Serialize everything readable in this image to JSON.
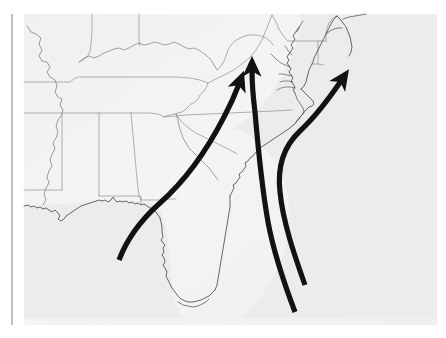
{
  "figure": {
    "kind": "map-figure",
    "canvas": {
      "width": 446,
      "height": 338,
      "background": "#ffffff"
    }
  },
  "map": {
    "region_label": "Southeastern United States",
    "panel": {
      "x": 24,
      "y": 14,
      "width": 413,
      "height": 311
    },
    "colors": {
      "page_background": "#ffffff",
      "map_background": "#f1f1f1",
      "land_fill": "#f3f3f3",
      "ocean_fill": "#eeeeee",
      "border_stroke": "#9a9a9a",
      "coastline_stroke": "#555555",
      "arrow_color": "#121212",
      "margin_rule": "#8e8e8e"
    },
    "strokes": {
      "state_border_width": 0.7,
      "coastline_width": 0.8,
      "arrow_width": 5.2,
      "margin_rule_width": 1.1
    }
  },
  "margin_rule": {
    "name": "left page rule",
    "x": 12,
    "y_top": 14,
    "y_bottom": 325
  },
  "arrows": [
    {
      "id": "arrow-1",
      "label": "Gulf track arrow",
      "origin": "eastern Gulf of Mexico",
      "destination": "Virginia / mid-Atlantic interior",
      "tail": [
        119,
        260
      ],
      "head": [
        240,
        79
      ],
      "head_angle_deg": 20,
      "path": "M119,260 C128,236 142,219 160,203 C186,180 208,148 224,117 C232,102 236,92 239,84"
    },
    {
      "id": "arrow-2",
      "label": "Atlantic inshore track arrow",
      "origin": "Atlantic waters southeast of Florida",
      "destination": "Virginia / Maryland",
      "tail": [
        295,
        312
      ],
      "head": [
        252,
        63
      ],
      "head_angle_deg": 0,
      "path": "M295,312 C284,283 274,254 268,222 C262,188 258,147 255,112 C253,96 252,82 252,70"
    },
    {
      "id": "arrow-3",
      "label": "Offshore recurving track arrow",
      "origin": "Atlantic waters east of Florida",
      "destination": "open Atlantic northeast of Cape Hatteras",
      "tail": [
        305,
        285
      ],
      "head": [
        347,
        73
      ],
      "head_angle_deg": 45,
      "path": "M305,285 C294,254 283,222 280,192 C277,166 284,146 300,131 C315,117 328,100 341,81"
    }
  ],
  "geography": {
    "state_outline_count": 18,
    "features": [
      "Gulf of Mexico coastline",
      "Florida peninsula",
      "Atlantic coastline",
      "Chesapeake Bay",
      "Delmarva Peninsula",
      "Mississippi River",
      "Ohio River",
      "Great Lakes edge"
    ],
    "states_shown": [
      "Missouri",
      "Illinois",
      "Indiana",
      "Ohio",
      "Kentucky",
      "Tennessee",
      "West Virginia",
      "Virginia",
      "Maryland",
      "Delaware",
      "New Jersey",
      "Pennsylvania",
      "North Carolina",
      "South Carolina",
      "Georgia",
      "Florida",
      "Alabama",
      "Mississippi",
      "Louisiana",
      "Arkansas"
    ]
  }
}
